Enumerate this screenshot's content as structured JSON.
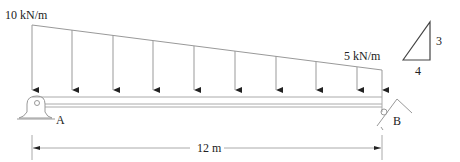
{
  "diagram": {
    "load": {
      "left_label": "10 kN/m",
      "right_label": "5 kN/m",
      "type": "linearly-varying distributed load",
      "arrow_count": 10
    },
    "supports": {
      "a_label": "A",
      "a_type": "pin",
      "b_label": "B",
      "b_type": "inclined roller"
    },
    "dimension": {
      "label": "12 m"
    },
    "slope_triangle": {
      "vertical_label": "3",
      "horizontal_label": "4"
    },
    "colors": {
      "line": "#888888",
      "arrow": "#222222",
      "text": "#222222"
    }
  }
}
